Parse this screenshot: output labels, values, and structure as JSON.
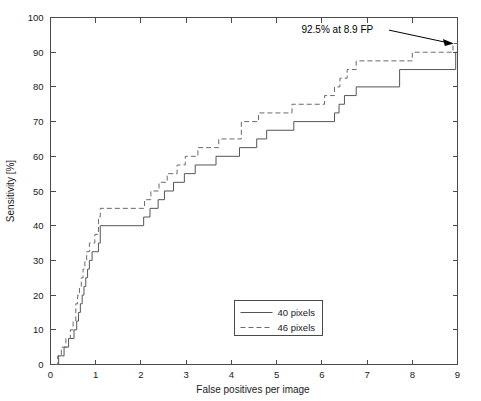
{
  "chart_data": {
    "type": "line",
    "title": "",
    "xlabel": "False positives per image",
    "ylabel": "Sensitivity [%]",
    "xlim": [
      0,
      9
    ],
    "ylim": [
      0,
      100
    ],
    "xticks": [
      0,
      1,
      2,
      3,
      4,
      5,
      6,
      7,
      8,
      9
    ],
    "yticks": [
      0,
      10,
      20,
      30,
      40,
      50,
      60,
      70,
      80,
      90,
      100
    ],
    "grid": false,
    "legend_position": "lower center",
    "step_style": "post",
    "series": [
      {
        "name": "40 pixels",
        "style": "solid",
        "color": "#555555",
        "x": [
          0.12,
          0.18,
          0.3,
          0.4,
          0.52,
          0.58,
          0.62,
          0.66,
          0.7,
          0.74,
          0.78,
          0.82,
          0.86,
          0.92,
          0.98,
          1.06,
          1.1,
          1.98,
          2.06,
          2.2,
          2.38,
          2.52,
          2.72,
          2.96,
          3.2,
          3.42,
          3.66,
          3.88,
          4.18,
          4.56,
          4.78,
          5.38,
          6.28,
          6.38,
          6.5,
          6.76,
          7.72,
          8.02,
          8.96
        ],
        "y": [
          0,
          2.5,
          5,
          7.5,
          10,
          12.5,
          15,
          17.5,
          20,
          22.5,
          25,
          27.5,
          30,
          32.5,
          32.5,
          35,
          40,
          40,
          42.5,
          45,
          47.5,
          50,
          52.5,
          55,
          57.5,
          57.5,
          60,
          60,
          62.5,
          65,
          67.5,
          70,
          72.5,
          75,
          77.5,
          80,
          85,
          85,
          90
        ]
      },
      {
        "name": "46 pixels",
        "style": "dashed",
        "color": "#6a6a6a",
        "x": [
          0.1,
          0.16,
          0.24,
          0.34,
          0.44,
          0.5,
          0.56,
          0.6,
          0.64,
          0.68,
          0.72,
          0.76,
          0.8,
          0.86,
          0.92,
          0.98,
          1.06,
          1.1,
          1.96,
          2.08,
          2.22,
          2.4,
          2.58,
          2.8,
          2.98,
          3.26,
          3.5,
          3.72,
          4.02,
          4.22,
          4.6,
          5.34,
          6.06,
          6.28,
          6.4,
          6.56,
          6.76,
          7.7,
          8.0,
          8.9
        ],
        "y": [
          0,
          2.5,
          5,
          7.5,
          10,
          12.5,
          17.5,
          20,
          22.5,
          25,
          27.5,
          30,
          32.5,
          35,
          35,
          37.5,
          42.5,
          45,
          45,
          47.5,
          50,
          52.5,
          55,
          57.5,
          60,
          62.5,
          62.5,
          65,
          65,
          70,
          72.5,
          75,
          77.5,
          80,
          82.5,
          85,
          87.5,
          87.5,
          90,
          92.5
        ]
      }
    ],
    "annotations": [
      {
        "text": "92.5% at 8.9 FP",
        "text_x": 5.55,
        "text_y": 95.5,
        "target_x": 8.92,
        "target_y": 92.5
      }
    ]
  }
}
